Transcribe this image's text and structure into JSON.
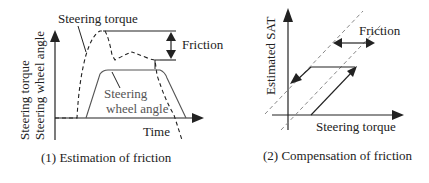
{
  "panel1": {
    "caption": "(1) Estimation of friction",
    "y_label_1": "Steering torque",
    "y_label_2": "Steering wheel angle",
    "x_label": "Time",
    "torque_label": "Steering torque",
    "angle_label_1": "Steering",
    "angle_label_2": "wheel angle",
    "friction_label": "Friction"
  },
  "panel2": {
    "caption": "(2) Compensation of friction",
    "y_label": "Estimated SAT",
    "x_label": "Steering torque",
    "friction_label": "Friction"
  },
  "colors": {
    "line": "#222222",
    "dashed_guide": "#888888",
    "angle_curve": "#555555"
  }
}
